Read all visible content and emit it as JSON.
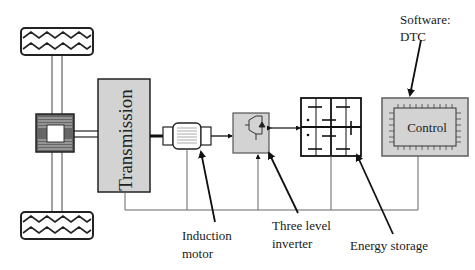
{
  "diagram": {
    "type": "block-diagram",
    "title": "",
    "blocks": [
      {
        "id": "wheel-top",
        "label": ""
      },
      {
        "id": "differential",
        "label": ""
      },
      {
        "id": "wheel-bottom",
        "label": ""
      },
      {
        "id": "transmission",
        "label": "Transmission"
      },
      {
        "id": "induction-motor",
        "label": ""
      },
      {
        "id": "inverter",
        "label": ""
      },
      {
        "id": "energy-storage",
        "label": ""
      },
      {
        "id": "control",
        "label": "Control"
      }
    ],
    "annotations": {
      "software": [
        "Software:",
        "DTC"
      ],
      "induction_motor": [
        "Induction",
        "motor"
      ],
      "inverter": [
        "Three level",
        "inverter"
      ],
      "energy_storage": [
        "Energy storage"
      ]
    },
    "colors": {
      "block_fill": "#d3d3d3",
      "stroke": "#222222",
      "bus_line": "#555555"
    }
  }
}
